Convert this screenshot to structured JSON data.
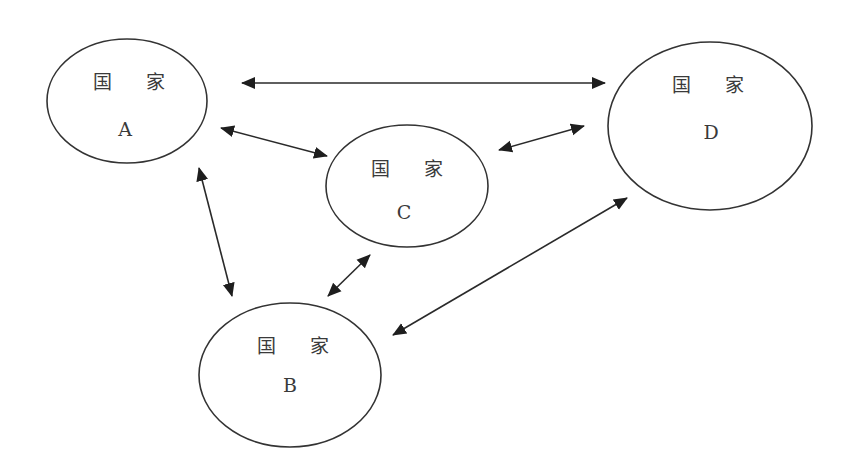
{
  "diagram": {
    "type": "network",
    "colors": {
      "stroke": "#333333",
      "text": "#3a3a3a",
      "background": "#ffffff"
    },
    "nodes": [
      {
        "id": "A",
        "title": "国 家",
        "letter": "A",
        "cx": 127,
        "cy": 101,
        "rx": 80,
        "ry": 62
      },
      {
        "id": "B",
        "title": "国 家",
        "letter": "B",
        "cx": 290,
        "cy": 375,
        "rx": 91,
        "ry": 72
      },
      {
        "id": "C",
        "title": "国 家",
        "letter": "C",
        "cx": 407,
        "cy": 186,
        "rx": 81,
        "ry": 61
      },
      {
        "id": "D",
        "title": "国 家",
        "letter": "D",
        "cx": 710,
        "cy": 126,
        "rx": 102,
        "ry": 84
      }
    ],
    "edges": [
      {
        "from": "A",
        "to": "D",
        "direction": "bidirectional"
      },
      {
        "from": "A",
        "to": "C",
        "direction": "bidirectional"
      },
      {
        "from": "C",
        "to": "D",
        "direction": "bidirectional"
      },
      {
        "from": "A",
        "to": "B",
        "direction": "bidirectional"
      },
      {
        "from": "C",
        "to": "B",
        "direction": "bidirectional"
      },
      {
        "from": "B",
        "to": "D",
        "direction": "bidirectional"
      }
    ]
  },
  "labels": {
    "node_a_title": "国 家",
    "node_a_letter": "A",
    "node_b_title": "国 家",
    "node_b_letter": "B",
    "node_c_title": "国 家",
    "node_c_letter": "C",
    "node_d_title": "国 家",
    "node_d_letter": "D"
  }
}
